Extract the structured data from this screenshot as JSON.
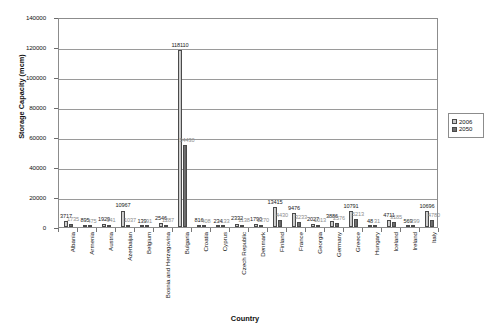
{
  "chart_data": {
    "type": "bar",
    "title": "",
    "xlabel": "Country",
    "ylabel": "Storage Capacity (mcm)",
    "ylim": [
      0,
      140000
    ],
    "ytick_values": [
      0,
      20000,
      40000,
      60000,
      80000,
      100000,
      120000,
      140000
    ],
    "ytick_labels": [
      "0",
      "20000",
      "40000",
      "60000",
      "80000",
      "100000",
      "120000",
      "140000"
    ],
    "grid": true,
    "legend_position": "right",
    "categories": [
      "Albania",
      "Armenia",
      "Austria",
      "Azerbaijan",
      "Belgium",
      "Bosnia and Herzegovina",
      "Bulgaria",
      "Croatia",
      "Cyprus",
      "Czech Republic",
      "Denmark",
      "Finland",
      "France",
      "Georgia",
      "Germany",
      "Greece",
      "Hungary",
      "Iceland",
      "Ireland",
      "Italy"
    ],
    "series": [
      {
        "name": "2006",
        "color": "#c9c9c9",
        "values": [
          3717,
          895,
          1929,
          10967,
          139,
          2546,
          118110,
          816,
          234,
          2332,
          1790,
          13415,
          9476,
          2027,
          3886,
          10791,
          48,
          4711,
          569,
          10696
        ]
      },
      {
        "name": "2050",
        "color": "#6e6e6e",
        "values": [
          1735,
          475,
          941,
          1037,
          91,
          1287,
          54430,
          408,
          133,
          1138,
          1270,
          4430,
          3233,
          1013,
          2576,
          5213,
          31,
          3185,
          299,
          4780
        ]
      }
    ],
    "data_labels_2006": [
      "3717",
      "895",
      "1929",
      "10967",
      "139",
      "2546",
      "118110",
      "816",
      "234",
      "2332",
      "1790",
      "13415",
      "9476",
      "2027",
      "3886",
      "10791",
      "48",
      "4711",
      "569",
      "10696"
    ],
    "data_labels_2050": [
      "1735",
      "475",
      "941",
      "1037",
      "91",
      "1287",
      "54430",
      "408",
      "133",
      "1138",
      "1270",
      "4430",
      "3233",
      "1013",
      "2576",
      "5213",
      "31",
      "3185",
      "299",
      "4780"
    ]
  },
  "legend": {
    "entries": [
      {
        "label": "2006"
      },
      {
        "label": "2050"
      }
    ]
  }
}
